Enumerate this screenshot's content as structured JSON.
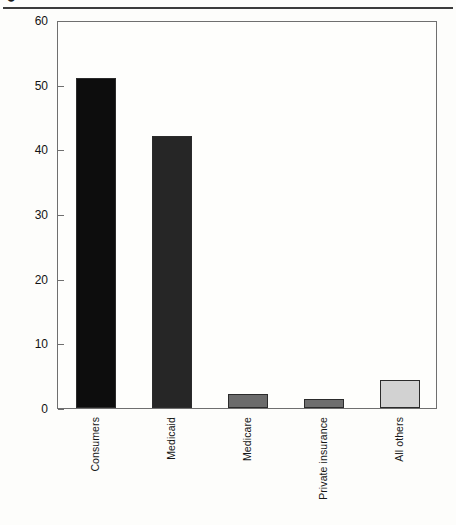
{
  "figure": {
    "caption_fragment_glyph": "●",
    "background_color": "#fdfdfb",
    "frame_color": "#6f6f6f"
  },
  "chart_data": {
    "type": "bar",
    "title": "",
    "subtitle": "",
    "xlabel": "",
    "ylabel": "Percentage of Nursing Home Bills",
    "categories": [
      "Consumers",
      "Medicaid",
      "Medicare",
      "Private insurance",
      "All others"
    ],
    "values": [
      51,
      42,
      2.2,
      1.4,
      4.4
    ],
    "series": [
      {
        "name": "Percentage of Nursing Home Bills",
        "values": [
          51,
          42,
          2.2,
          1.4,
          4.4
        ]
      }
    ],
    "bar_colors": [
      "#0d0d0d",
      "#262626",
      "#6b6b6b",
      "#6e6e6e",
      "#d2d2d2"
    ],
    "bar_border_color": "#2b2b2b",
    "ylim": [
      0,
      60
    ],
    "yticks": [
      0,
      10,
      20,
      30,
      40,
      50,
      60
    ],
    "ytick_labels": [
      "0",
      "10",
      "20",
      "30",
      "40",
      "50",
      "60"
    ],
    "xlim": [
      0,
      5
    ],
    "grid": false,
    "legend": false,
    "legend_position": "none",
    "annotations": [],
    "xtick_rotation": 90
  }
}
